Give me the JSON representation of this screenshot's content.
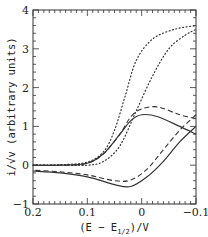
{
  "chart_data": {
    "type": "line",
    "title": "",
    "xlabel": "(E − E1/2)/V",
    "ylabel": "i/√v (arbitrary units)",
    "xlim": [
      0.2,
      -0.1
    ],
    "ylim": [
      -1,
      4
    ],
    "x_reversed": true,
    "grid": false,
    "legend": null,
    "xticks": [
      {
        "value": 0.2,
        "label": "0.2"
      },
      {
        "value": 0.1,
        "label": "0.1"
      },
      {
        "value": 0.0,
        "label": "0"
      },
      {
        "value": -0.1,
        "label": "−0.1"
      }
    ],
    "yticks": [
      {
        "value": -1,
        "label": "−1"
      },
      {
        "value": 0,
        "label": "0"
      },
      {
        "value": 1,
        "label": "1"
      },
      {
        "value": 2,
        "label": "2"
      },
      {
        "value": 3,
        "label": "3"
      },
      {
        "value": 4,
        "label": "4"
      }
    ],
    "series": [
      {
        "name": "dotted-1",
        "style": "dotted",
        "points": [
          [
            0.2,
            0.0
          ],
          [
            0.15,
            0.01
          ],
          [
            0.1,
            0.08
          ],
          [
            0.07,
            0.35
          ],
          [
            0.05,
            0.9
          ],
          [
            0.03,
            1.8
          ],
          [
            0.01,
            2.7
          ],
          [
            -0.02,
            3.25
          ],
          [
            -0.06,
            3.5
          ],
          [
            -0.1,
            3.6
          ]
        ]
      },
      {
        "name": "dotted-2",
        "style": "dotted",
        "points": [
          [
            0.2,
            0.0
          ],
          [
            0.15,
            0.0
          ],
          [
            0.1,
            0.0
          ],
          [
            0.07,
            0.1
          ],
          [
            0.04,
            0.5
          ],
          [
            0.01,
            1.4
          ],
          [
            -0.02,
            2.3
          ],
          [
            -0.05,
            3.0
          ],
          [
            -0.08,
            3.35
          ],
          [
            -0.1,
            3.5
          ]
        ]
      },
      {
        "name": "solid-cv",
        "style": "solid",
        "forward": [
          [
            0.2,
            0.0
          ],
          [
            0.15,
            0.0
          ],
          [
            0.1,
            0.05
          ],
          [
            0.07,
            0.3
          ],
          [
            0.04,
            0.8
          ],
          [
            0.02,
            1.15
          ],
          [
            0.0,
            1.3
          ],
          [
            -0.03,
            1.25
          ],
          [
            -0.07,
            1.0
          ],
          [
            -0.1,
            0.8
          ]
        ],
        "reverse": [
          [
            -0.1,
            1.0
          ],
          [
            -0.07,
            0.6
          ],
          [
            -0.04,
            0.1
          ],
          [
            -0.01,
            -0.3
          ],
          [
            0.02,
            -0.55
          ],
          [
            0.05,
            -0.5
          ],
          [
            0.1,
            -0.3
          ],
          [
            0.15,
            -0.2
          ],
          [
            0.2,
            -0.15
          ]
        ]
      },
      {
        "name": "dashed-cv",
        "style": "dashed",
        "forward": [
          [
            0.2,
            0.0
          ],
          [
            0.15,
            0.0
          ],
          [
            0.1,
            0.05
          ],
          [
            0.07,
            0.3
          ],
          [
            0.04,
            0.8
          ],
          [
            0.02,
            1.25
          ],
          [
            0.0,
            1.45
          ],
          [
            -0.03,
            1.5
          ],
          [
            -0.07,
            1.3
          ],
          [
            -0.1,
            1.2
          ]
        ],
        "reverse": [
          [
            -0.1,
            1.3
          ],
          [
            -0.07,
            0.9
          ],
          [
            -0.04,
            0.4
          ],
          [
            -0.01,
            -0.1
          ],
          [
            0.02,
            -0.38
          ],
          [
            0.05,
            -0.4
          ],
          [
            0.1,
            -0.25
          ],
          [
            0.15,
            -0.17
          ],
          [
            0.2,
            -0.13
          ]
        ]
      }
    ]
  },
  "axes": {
    "x_label_main": "(E − E",
    "x_label_sub": "1/2",
    "x_label_tail": ")/V",
    "y_label": "i/√v (arbitrary units)"
  }
}
